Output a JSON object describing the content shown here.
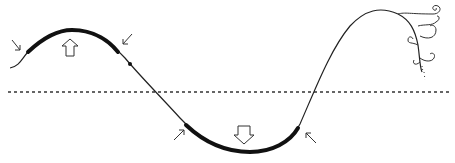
{
  "diagram": {
    "baseline": {
      "style": "dotted",
      "y": 92
    },
    "crest": {
      "arrow": "up",
      "thick_segment": true,
      "pointer_arrows": 2
    },
    "trough": {
      "arrow": "down",
      "thick_segment": true,
      "pointer_arrows": 2
    },
    "ornament": "spiral-curls",
    "colors": {
      "stroke": "#222222",
      "background": "#ffffff"
    }
  }
}
